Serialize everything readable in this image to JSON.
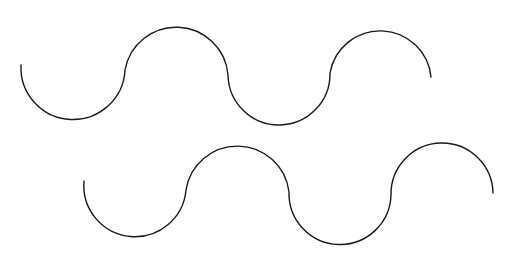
{
  "canvas": {
    "width": 512,
    "height": 254,
    "background": "#ffffff"
  },
  "stroke": {
    "color": "#1a1a1a",
    "width": 1.4
  },
  "waves": [
    {
      "name": "top-wave",
      "start": [
        21,
        65
      ],
      "segments": [
        {
          "type": "arc",
          "rx": 52,
          "ry": 52,
          "sweep": 0,
          "to": [
            125,
            70
          ]
        },
        {
          "type": "arc",
          "rx": 52,
          "ry": 52,
          "sweep": 1,
          "to": [
            228,
            75
          ]
        },
        {
          "type": "arc",
          "rx": 51,
          "ry": 51,
          "sweep": 0,
          "to": [
            330,
            73
          ]
        },
        {
          "type": "arc",
          "rx": 51,
          "ry": 51,
          "sweep": 1,
          "to": [
            431,
            77
          ]
        }
      ]
    },
    {
      "name": "bottom-wave",
      "start": [
        84,
        181
      ],
      "segments": [
        {
          "type": "arc",
          "rx": 51,
          "ry": 51,
          "sweep": 0,
          "to": [
            186,
            190
          ]
        },
        {
          "type": "arc",
          "rx": 52,
          "ry": 52,
          "sweep": 1,
          "to": [
            289,
            192
          ]
        },
        {
          "type": "arc",
          "rx": 51,
          "ry": 51,
          "sweep": 0,
          "to": [
            391,
            195
          ]
        },
        {
          "type": "arc",
          "rx": 51,
          "ry": 51,
          "sweep": 1,
          "to": [
            493,
            193
          ]
        }
      ]
    }
  ]
}
